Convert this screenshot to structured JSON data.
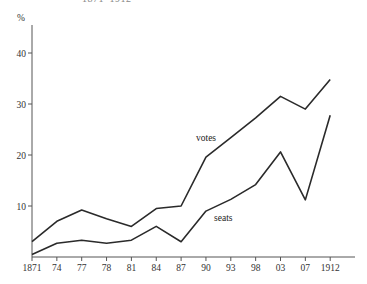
{
  "header": {
    "title_clipped": "1871–1912"
  },
  "chart_data": {
    "type": "line",
    "title": "1871–1912",
    "xlabel": "",
    "ylabel": "%",
    "categories": [
      "1871",
      "74",
      "77",
      "78",
      "81",
      "84",
      "87",
      "90",
      "93",
      "98",
      "03",
      "07",
      "1912"
    ],
    "ylim": [
      0,
      45
    ],
    "yticks": [
      10,
      20,
      30,
      40
    ],
    "grid": false,
    "legend": "inline labels",
    "series": [
      {
        "name": "votes",
        "values": [
          3.0,
          7.0,
          9.2,
          7.5,
          6.0,
          9.5,
          10.0,
          19.6,
          23.4,
          27.3,
          31.5,
          29.0,
          34.8
        ]
      },
      {
        "name": "seats",
        "values": [
          0.5,
          2.7,
          3.3,
          2.7,
          3.3,
          6.0,
          3.0,
          9.0,
          11.3,
          14.2,
          20.6,
          11.2,
          27.8
        ]
      }
    ],
    "annotations": [
      {
        "text": "votes",
        "near": "90–93"
      },
      {
        "text": "seats",
        "near": "90–93"
      }
    ]
  }
}
